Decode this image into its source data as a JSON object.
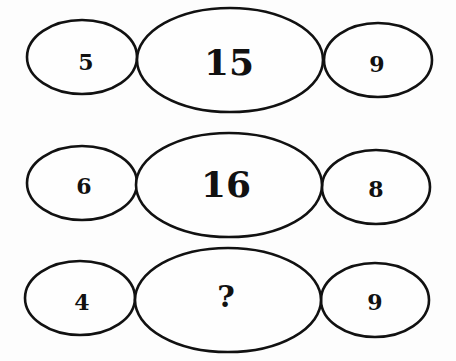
{
  "puzzle": {
    "rows": [
      {
        "left": "5",
        "center": "15",
        "right": "9"
      },
      {
        "left": "6",
        "center": "16",
        "right": "8"
      },
      {
        "left": "4",
        "center": "?",
        "right": "9"
      }
    ]
  }
}
